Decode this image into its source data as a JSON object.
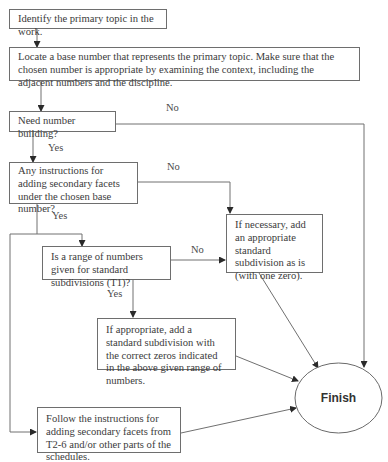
{
  "diagram": {
    "type": "flowchart",
    "nodes": [
      {
        "id": "identify",
        "text": "Identify the primary topic in the work."
      },
      {
        "id": "locate",
        "text": "Locate a base number that represents the primary topic. Make sure that the chosen number is appropriate by examining the context, including the adjacent numbers and the discipline."
      },
      {
        "id": "need_building",
        "text": "Need number building?"
      },
      {
        "id": "any_instructions",
        "text": "Any instructions for adding secondary facets under the chosen base number?"
      },
      {
        "id": "if_necessary",
        "text": "If necessary, add an appropriate standard subdivision as is (with one zero)."
      },
      {
        "id": "range_given",
        "text": "Is a range of numbers given for standard subdivisions (T1)?"
      },
      {
        "id": "if_appropriate",
        "text": "If appropriate, add a standard subdivision with the correct zeros indicated in the above given range of numbers."
      },
      {
        "id": "follow_instructions",
        "text": "Follow the instructions for adding secondary facets from T2-6 and/or other parts of the schedules."
      },
      {
        "id": "finish",
        "text": "Finish"
      }
    ],
    "edge_labels": {
      "need_no": "No",
      "need_yes": "Yes",
      "instr_no": "No",
      "instr_yes": "Yes",
      "range_no": "No",
      "range_yes": "Yes"
    },
    "edges": [
      {
        "from": "identify",
        "to": "locate",
        "label": ""
      },
      {
        "from": "locate",
        "to": "need_building",
        "label": ""
      },
      {
        "from": "need_building",
        "to": "finish",
        "label": "No"
      },
      {
        "from": "need_building",
        "to": "any_instructions",
        "label": "Yes"
      },
      {
        "from": "any_instructions",
        "to": "if_necessary",
        "label": "No"
      },
      {
        "from": "any_instructions",
        "to": "range_given",
        "label": "Yes"
      },
      {
        "from": "any_instructions",
        "to": "follow_instructions",
        "label": "Yes"
      },
      {
        "from": "range_given",
        "to": "if_necessary",
        "label": "No"
      },
      {
        "from": "range_given",
        "to": "if_appropriate",
        "label": "Yes"
      },
      {
        "from": "if_necessary",
        "to": "finish",
        "label": ""
      },
      {
        "from": "if_appropriate",
        "to": "finish",
        "label": ""
      },
      {
        "from": "follow_instructions",
        "to": "finish",
        "label": ""
      }
    ]
  }
}
